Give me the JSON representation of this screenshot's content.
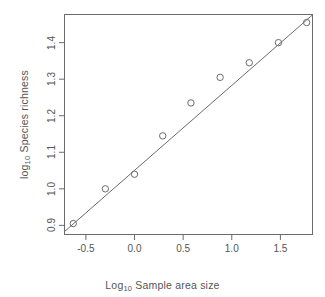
{
  "chart_data": {
    "type": "scatter",
    "title": "",
    "xlabel": "Log10 Sample area size",
    "ylabel": "log10 Species richness",
    "xlabel_parts": {
      "prefix": "Log",
      "sub": "10",
      "suffix": " Sample area size"
    },
    "ylabel_parts": {
      "prefix": "log",
      "sub": "10",
      "suffix": " Species richness"
    },
    "x": [
      -0.63,
      -0.3,
      0.0,
      0.29,
      0.58,
      0.88,
      1.18,
      1.48,
      1.77
    ],
    "y": [
      0.905,
      1.0,
      1.04,
      1.145,
      1.235,
      1.305,
      1.345,
      1.4,
      1.455
    ],
    "xlim": [
      -0.72,
      1.83
    ],
    "ylim": [
      0.875,
      1.477
    ],
    "xticks": [
      -0.5,
      0.0,
      0.5,
      1.0,
      1.5
    ],
    "xticklabels": [
      "-0.5",
      "0.0",
      "0.5",
      "1.0",
      "1.5"
    ],
    "yticks": [
      0.9,
      1.0,
      1.1,
      1.2,
      1.3,
      1.4
    ],
    "yticklabels": [
      "0.9",
      "1.0",
      "1.1",
      "1.2",
      "1.3",
      "1.4"
    ],
    "grid": false,
    "legend": null,
    "marker": "open-circle",
    "marker_size": 3.2,
    "series": [
      {
        "name": "observations",
        "type": "scatter",
        "points": [
          {
            "x": -0.63,
            "y": 0.905
          },
          {
            "x": -0.3,
            "y": 1.0
          },
          {
            "x": 0.0,
            "y": 1.04
          },
          {
            "x": 0.29,
            "y": 1.145
          },
          {
            "x": 0.58,
            "y": 1.235
          },
          {
            "x": 0.88,
            "y": 1.305
          },
          {
            "x": 1.18,
            "y": 1.345
          },
          {
            "x": 1.48,
            "y": 1.4
          },
          {
            "x": 1.77,
            "y": 1.455
          }
        ]
      },
      {
        "name": "regression-line",
        "type": "line",
        "slope": 0.2326,
        "intercept": 1.0503,
        "x_start": -0.72,
        "x_end": 1.83,
        "y_start": 0.883,
        "y_end": 1.476
      }
    ],
    "colors": {
      "axis": "#6b6b6b",
      "marker": "#6b6b6b",
      "line": "#6b6b6b",
      "text": "#555555",
      "background": "#ffffff"
    }
  }
}
